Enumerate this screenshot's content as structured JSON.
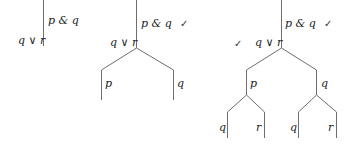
{
  "diagram": {
    "type": "truth-tree",
    "trees": [
      {
        "name": "tree-1",
        "premises": [
          {
            "label": "p & q",
            "checked": false
          },
          {
            "label": "q ∨ r",
            "checked": false
          }
        ]
      },
      {
        "name": "tree-2",
        "premises": [
          {
            "label": "p & q",
            "checked": true
          },
          {
            "label": "q ∨ r",
            "checked": false
          }
        ],
        "branches": [
          {
            "label": "p"
          },
          {
            "label": "q"
          }
        ]
      },
      {
        "name": "tree-3",
        "premises": [
          {
            "label": "p & q",
            "checked": true
          },
          {
            "label": "q ∨ r",
            "checked": true
          }
        ],
        "branches": [
          {
            "label": "p",
            "children": [
              {
                "label": "q"
              },
              {
                "label": "r"
              }
            ]
          },
          {
            "label": "q",
            "children": [
              {
                "label": "q"
              },
              {
                "label": "r"
              }
            ]
          }
        ]
      }
    ],
    "check_mark": "✓",
    "line_color": "#6e6e6e"
  },
  "labels": {
    "t1_pq": "p & q",
    "t1_qr": "q ∨ r",
    "t2_pq": "p & q",
    "t2_qr": "q ∨ r",
    "t2_left": "p",
    "t2_right": "q",
    "t3_pq": "p & q",
    "t3_qr": "q ∨ r",
    "t3_left": "p",
    "t3_right": "q",
    "t3_ll": "q",
    "t3_lr": "r",
    "t3_rl": "q",
    "t3_rr": "r",
    "check": "✓"
  }
}
